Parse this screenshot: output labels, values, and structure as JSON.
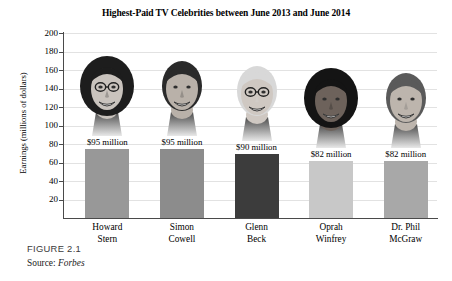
{
  "figure": {
    "caption": "FIGURE 2.1",
    "source_prefix": "Source: ",
    "source_name": "Forbes"
  },
  "chart_data": {
    "type": "bar",
    "title": "Highest-Paid TV Celebrities between June 2013 and June 2014",
    "xlabel": "",
    "ylabel": "Earnings (millions of dollars)",
    "ylim": [
      0,
      200
    ],
    "ytick_step": 20,
    "yticks": [
      0,
      20,
      40,
      60,
      80,
      100,
      120,
      140,
      160,
      180,
      200
    ],
    "ytick_labels": [
      "20",
      "40",
      "60",
      "80",
      "100",
      "120",
      "140",
      "160",
      "180",
      "200"
    ],
    "grid": true,
    "legend": "none",
    "categories": [
      [
        "Howard",
        "Stern"
      ],
      [
        "Simon",
        "Cowell"
      ],
      [
        "Glenn",
        "Beck"
      ],
      [
        "Oprah",
        "Winfrey"
      ],
      [
        "Dr. Phil",
        "McGraw"
      ]
    ],
    "values": [
      95,
      95,
      90,
      82,
      82
    ],
    "data_labels": [
      "$95 million",
      "$95 million",
      "$90 million",
      "$82 million",
      "$82 million"
    ],
    "bar_colors": [
      "#989898",
      "#8c8c8c",
      "#3c3c3c",
      "#c8c8c8",
      "#a8a8a8"
    ],
    "portrait_names": [
      "howard-stern-portrait",
      "simon-cowell-portrait",
      "glenn-beck-portrait",
      "oprah-winfrey-portrait",
      "dr-phil-mcgraw-portrait"
    ]
  }
}
